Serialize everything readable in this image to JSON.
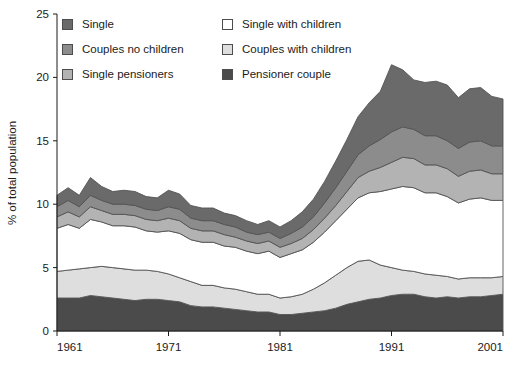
{
  "chart_data": {
    "type": "area",
    "title": "",
    "subtitle": "",
    "xlabel": "",
    "ylabel": "% of total population",
    "xlim": [
      1961,
      2001
    ],
    "ylim": [
      0,
      25
    ],
    "ytick_values": [
      0,
      5,
      10,
      15,
      20,
      25
    ],
    "ytick_labels": [
      "0",
      "5",
      "10",
      "15",
      "20",
      "25"
    ],
    "xtick_values": [
      1961,
      1971,
      1981,
      1991,
      2001
    ],
    "xtick_labels": [
      "1961",
      "1971",
      "1981",
      "1991",
      "2001"
    ],
    "grid": false,
    "stacked": true,
    "legend_position": "top-inside",
    "x": [
      1961,
      1962,
      1963,
      1964,
      1965,
      1966,
      1967,
      1968,
      1969,
      1970,
      1971,
      1972,
      1973,
      1974,
      1975,
      1976,
      1977,
      1978,
      1979,
      1980,
      1981,
      1982,
      1983,
      1984,
      1985,
      1986,
      1987,
      1988,
      1989,
      1990,
      1991,
      1992,
      1993,
      1994,
      1995,
      1996,
      1997,
      1998,
      1999,
      2000,
      2001
    ],
    "series": [
      {
        "name": "Pensioner couple",
        "color": "#4b4b4b",
        "stack_order": 1,
        "values": [
          2.6,
          2.6,
          2.6,
          2.8,
          2.7,
          2.6,
          2.5,
          2.4,
          2.5,
          2.5,
          2.4,
          2.3,
          2.0,
          1.9,
          1.9,
          1.8,
          1.7,
          1.6,
          1.5,
          1.5,
          1.3,
          1.3,
          1.4,
          1.5,
          1.6,
          1.8,
          2.1,
          2.3,
          2.5,
          2.6,
          2.8,
          2.9,
          2.9,
          2.7,
          2.6,
          2.7,
          2.6,
          2.7,
          2.7,
          2.8,
          2.9
        ]
      },
      {
        "name": "Couples with children",
        "color": "#dedede",
        "stack_order": 2,
        "values": [
          2.1,
          2.2,
          2.3,
          2.2,
          2.4,
          2.4,
          2.4,
          2.4,
          2.3,
          2.2,
          2.1,
          1.9,
          1.9,
          1.7,
          1.7,
          1.6,
          1.6,
          1.5,
          1.4,
          1.4,
          1.3,
          1.4,
          1.5,
          1.8,
          2.2,
          2.6,
          2.9,
          3.2,
          3.1,
          2.6,
          2.2,
          1.9,
          1.8,
          1.8,
          1.8,
          1.6,
          1.5,
          1.5,
          1.5,
          1.4,
          1.4
        ]
      },
      {
        "name": "Single with children",
        "color": "#ffffff",
        "stack_order": 3,
        "values": [
          3.4,
          3.6,
          3.2,
          3.8,
          3.5,
          3.3,
          3.4,
          3.4,
          3.1,
          3.1,
          3.4,
          3.5,
          3.3,
          3.4,
          3.4,
          3.3,
          3.3,
          3.2,
          3.2,
          3.4,
          3.2,
          3.4,
          3.5,
          3.7,
          4.0,
          4.3,
          4.6,
          5.0,
          5.3,
          5.8,
          6.2,
          6.6,
          6.6,
          6.4,
          6.5,
          6.3,
          6.0,
          6.2,
          6.3,
          6.1,
          6.0
        ]
      },
      {
        "name": "Single pensioners",
        "color": "#b3b3b3",
        "stack_order": 4,
        "values": [
          0.9,
          1.0,
          0.9,
          1.0,
          0.9,
          0.9,
          0.9,
          0.9,
          0.9,
          0.9,
          1.0,
          1.0,
          0.9,
          0.9,
          0.9,
          0.9,
          0.8,
          0.8,
          0.8,
          0.8,
          0.8,
          0.8,
          0.9,
          1.0,
          1.1,
          1.2,
          1.4,
          1.6,
          1.7,
          1.9,
          2.1,
          2.3,
          2.3,
          2.2,
          2.2,
          2.2,
          2.1,
          2.2,
          2.2,
          2.1,
          2.1
        ]
      },
      {
        "name": "Couples no children",
        "color": "#8c8c8c",
        "stack_order": 5,
        "values": [
          0.8,
          0.9,
          0.8,
          0.9,
          0.8,
          0.8,
          0.8,
          0.8,
          0.8,
          0.8,
          0.9,
          0.9,
          0.8,
          0.8,
          0.8,
          0.8,
          0.8,
          0.7,
          0.7,
          0.7,
          0.7,
          0.8,
          0.9,
          1.0,
          1.2,
          1.4,
          1.6,
          1.8,
          2.0,
          2.2,
          2.4,
          2.4,
          2.3,
          2.3,
          2.3,
          2.2,
          2.2,
          2.3,
          2.3,
          2.2,
          2.2
        ]
      },
      {
        "name": "Single",
        "color": "#6a6a6a",
        "stack_order": 6,
        "values": [
          0.9,
          1.0,
          0.9,
          1.4,
          1.1,
          1.0,
          1.1,
          1.1,
          1.0,
          1.0,
          1.3,
          1.2,
          1.0,
          1.0,
          1.0,
          0.9,
          0.9,
          0.9,
          0.8,
          0.9,
          0.9,
          1.0,
          1.2,
          1.4,
          1.7,
          2.1,
          2.5,
          3.0,
          3.4,
          3.8,
          5.3,
          4.5,
          3.9,
          4.2,
          4.3,
          4.4,
          4.0,
          4.2,
          4.2,
          3.9,
          3.7
        ]
      }
    ],
    "totals": [
      10.7,
      11.3,
      10.7,
      12.1,
      11.4,
      11.0,
      11.1,
      11.0,
      10.6,
      10.5,
      11.1,
      10.8,
      9.9,
      9.7,
      9.7,
      9.3,
      9.1,
      8.7,
      8.4,
      8.7,
      8.2,
      8.7,
      9.4,
      10.4,
      11.8,
      13.4,
      15.1,
      16.9,
      18.0,
      18.9,
      21.0,
      20.6,
      19.8,
      19.6,
      19.7,
      19.4,
      18.4,
      19.1,
      19.2,
      18.5,
      18.3
    ]
  },
  "legend": {
    "columns": [
      {
        "items": [
          {
            "label": "Single",
            "color": "#6a6a6a",
            "swatch": "legend-swatch-single"
          },
          {
            "label": "Couples no children",
            "color": "#8c8c8c",
            "swatch": "legend-swatch-couples-no-children"
          },
          {
            "label": "Single pensioners",
            "color": "#b3b3b3",
            "swatch": "legend-swatch-single-pensioners"
          }
        ]
      },
      {
        "items": [
          {
            "label": "Single with children",
            "color": "#ffffff",
            "swatch": "legend-swatch-single-with-children"
          },
          {
            "label": "Couples with children",
            "color": "#dedede",
            "swatch": "legend-swatch-couples-with-children"
          },
          {
            "label": "Pensioner couple",
            "color": "#4b4b4b",
            "swatch": "legend-swatch-pensioner-couple"
          }
        ]
      }
    ]
  },
  "axes": {
    "y_label": "% of total population",
    "y_ticks": [
      "25",
      "20",
      "15",
      "10",
      "5",
      "0"
    ],
    "x_ticks": [
      "1961",
      "1971",
      "1981",
      "1991",
      "2001"
    ]
  },
  "colors": {
    "axis": "#1b1b1b",
    "outline": "#4d4d4d",
    "background": "#ffffff"
  }
}
